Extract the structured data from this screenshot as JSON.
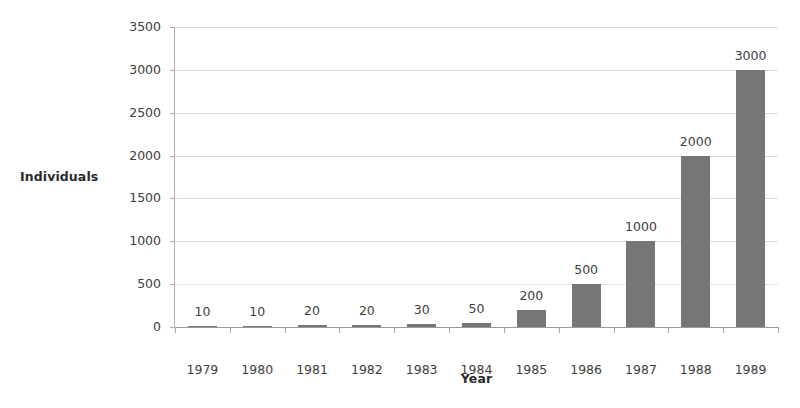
{
  "chart_data": {
    "type": "bar",
    "title": "",
    "xlabel": "Year",
    "ylabel": "Individuals",
    "categories": [
      "1979",
      "1980",
      "1981",
      "1982",
      "1983",
      "1984",
      "1985",
      "1986",
      "1987",
      "1988",
      "1989"
    ],
    "values": [
      10,
      10,
      20,
      20,
      30,
      50,
      200,
      500,
      1000,
      2000,
      3000
    ],
    "data_labels": [
      "10",
      "10",
      "20",
      "20",
      "30",
      "50",
      "200",
      "500",
      "1000",
      "2000",
      "3000"
    ],
    "ylim": [
      0,
      3500
    ],
    "ytick_values": [
      0,
      500,
      1000,
      1500,
      2000,
      2500,
      3000,
      3500
    ],
    "ytick_labels": [
      "0",
      "500",
      "1000",
      "1500",
      "2000",
      "2500",
      "3000",
      "3500"
    ],
    "grid": true,
    "legend": false,
    "legend_position": "none",
    "series": [
      {
        "name": "Individuals",
        "values": [
          10,
          10,
          20,
          20,
          30,
          50,
          200,
          500,
          1000,
          2000,
          3000
        ]
      }
    ],
    "colors": {
      "bar": "#767676",
      "gridline": "#d9d9d9",
      "axis": "#a8a8a8",
      "text": "#404040",
      "axis_title": "#2b2b2b",
      "background": "#ffffff"
    }
  }
}
